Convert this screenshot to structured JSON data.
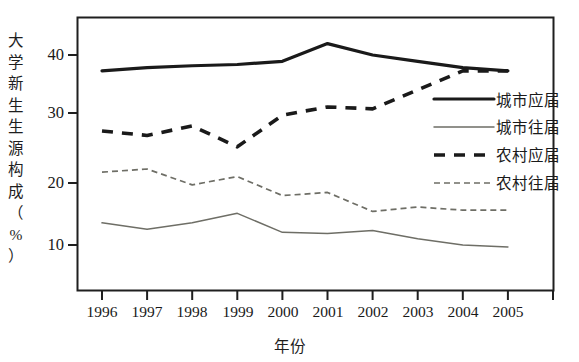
{
  "chart_data": {
    "type": "line",
    "title": "",
    "xlabel": "年份",
    "ylabel": "大学新生生源构成（%）",
    "categories": [
      "1996",
      "1997",
      "1998",
      "1999",
      "2000",
      "2001",
      "2002",
      "2003",
      "2004",
      "2005"
    ],
    "x": [
      1996,
      1997,
      1998,
      1999,
      2000,
      2001,
      2002,
      2003,
      2004,
      2005
    ],
    "ylim": [
      5,
      45
    ],
    "xlim": [
      1995.5,
      2006
    ],
    "yticks": [
      10,
      20,
      30,
      40
    ],
    "ytick_labels": [
      "10",
      "20",
      "30",
      "40"
    ],
    "grid": false,
    "legend_position": "center right",
    "series": [
      {
        "name": "城市应届",
        "style": "solid-thick",
        "color": "#1a1a1a",
        "values": [
          37.5,
          38.0,
          38.3,
          38.5,
          39.0,
          41.8,
          40.0,
          39.0,
          38.0,
          37.5
        ]
      },
      {
        "name": "城市往届",
        "style": "solid-thin",
        "color": "#6e6e66",
        "values": [
          13.5,
          12.5,
          13.5,
          15.0,
          12.0,
          11.8,
          12.3,
          11.0,
          10.0,
          9.7
        ]
      },
      {
        "name": "农村应届",
        "style": "dashed-thick",
        "color": "#1a1a1a",
        "values": [
          28.0,
          27.3,
          28.8,
          25.5,
          30.5,
          31.8,
          31.5,
          34.5,
          37.5,
          37.5
        ]
      },
      {
        "name": "农村往届",
        "style": "dotted-thin",
        "color": "#6e6e66",
        "values": [
          21.5,
          22.0,
          19.5,
          20.8,
          17.8,
          18.3,
          15.3,
          16.0,
          15.5,
          15.5
        ]
      }
    ]
  },
  "axis": {
    "ylabel_chars": [
      "大",
      "学",
      "新",
      "生",
      "生",
      "源",
      "构",
      "成",
      "（",
      "%",
      "）"
    ],
    "ytick_labels": [
      "40",
      "30",
      "20",
      "10"
    ],
    "xtick_labels": [
      "1996",
      "1997",
      "1998",
      "1999",
      "2000",
      "2001",
      "2002",
      "2003",
      "2004",
      "2005"
    ],
    "xlabel": "年份"
  },
  "legend": {
    "items": [
      {
        "label": "城市应届",
        "style": "solid-thick"
      },
      {
        "label": "城市往届",
        "style": "solid-thin"
      },
      {
        "label": "农村应届",
        "style": "dashed-thick"
      },
      {
        "label": "农村往届",
        "style": "dotted-thin"
      }
    ]
  }
}
